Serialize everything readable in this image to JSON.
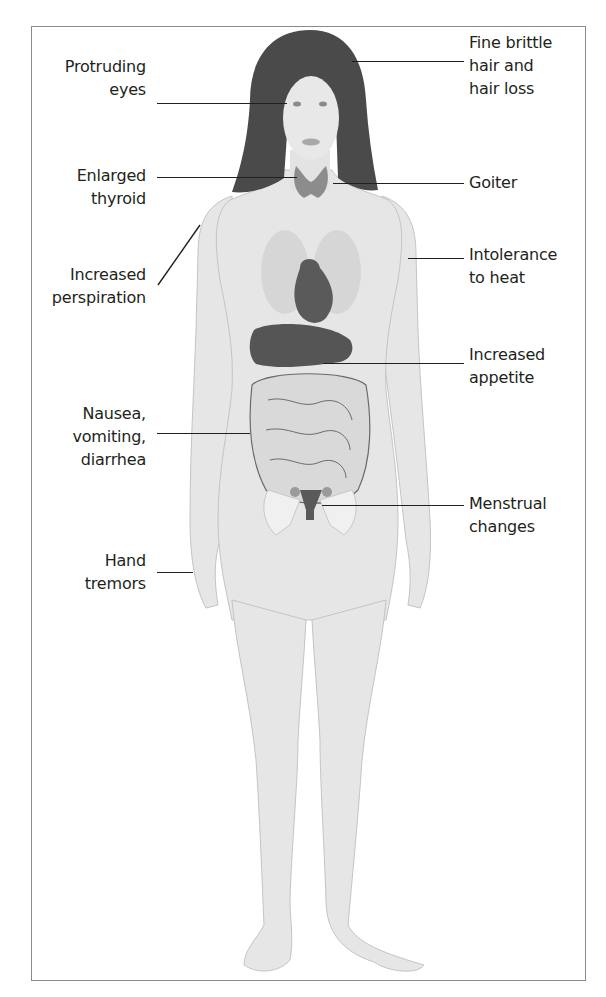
{
  "colors": {
    "skin": "#e6e6e6",
    "skin_outline": "#b8b8b8",
    "hair": "#4a4a4a",
    "thyroid": "#8c8c8c",
    "heart": "#5a5a5a",
    "liver": "#555555",
    "intestine": "#d9d9d9",
    "label_text": "#231f20",
    "frame_border": "#8a8a8a"
  },
  "labels": {
    "left": [
      {
        "id": "protruding-eyes",
        "lines": [
          "Protruding",
          "eyes"
        ]
      },
      {
        "id": "enlarged-thyroid",
        "lines": [
          "Enlarged",
          "thyroid"
        ]
      },
      {
        "id": "increased-perspiration",
        "lines": [
          "Increased",
          "perspiration"
        ]
      },
      {
        "id": "nausea-vomiting-diarrhea",
        "lines": [
          "Nausea,",
          "vomiting,",
          "diarrhea"
        ]
      },
      {
        "id": "hand-tremors",
        "lines": [
          "Hand",
          "tremors"
        ]
      }
    ],
    "right": [
      {
        "id": "fine-brittle-hair",
        "lines": [
          "Fine brittle",
          "hair and",
          "hair loss"
        ]
      },
      {
        "id": "goiter",
        "lines": [
          "Goiter"
        ]
      },
      {
        "id": "intolerance-to-heat",
        "lines": [
          "Intolerance",
          "to heat"
        ]
      },
      {
        "id": "increased-appetite",
        "lines": [
          "Increased",
          "appetite"
        ]
      },
      {
        "id": "menstrual-changes",
        "lines": [
          "Menstrual",
          "changes"
        ]
      }
    ]
  }
}
